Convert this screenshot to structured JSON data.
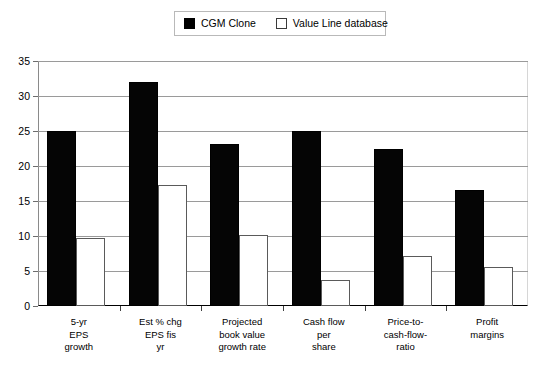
{
  "chart_data": {
    "type": "bar",
    "title": "",
    "subtitle": "",
    "xlabel": "",
    "ylabel": "",
    "ylim": [
      0,
      35
    ],
    "yticks": [
      0,
      5,
      10,
      15,
      20,
      25,
      30,
      35
    ],
    "ytick_labels": [
      "0",
      "5",
      "10",
      "15",
      "20",
      "25",
      "30",
      "35"
    ],
    "grid": true,
    "legend_position": "top-center",
    "categories": [
      "5-yr\nEPS\ngrowth",
      "Est % chg\nEPS fis\nyr",
      "Projected\nbook value\ngrowth rate",
      "Cash flow\nper\nshare",
      "Price-to-\ncash-flow-\nratio",
      "Profit\nmargins"
    ],
    "series": [
      {
        "name": "CGM Clone",
        "color": "#000000",
        "style": "filled",
        "values": [
          25.0,
          32.0,
          23.1,
          25.0,
          22.4,
          16.6
        ]
      },
      {
        "name": "Value Line database",
        "color": "#ffffff",
        "style": "open",
        "values": [
          9.7,
          17.3,
          10.2,
          3.7,
          7.1,
          5.6
        ]
      }
    ]
  },
  "legend": {
    "entries": [
      {
        "label": "CGM Clone",
        "swatch": "filled-square-icon"
      },
      {
        "label": "Value Line database",
        "swatch": "open-square-icon"
      }
    ]
  }
}
